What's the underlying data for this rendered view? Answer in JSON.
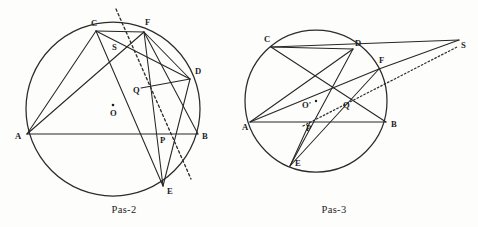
{
  "figure": {
    "background_color": "#fdfdfc",
    "ink_color": "#262626",
    "panels": [
      {
        "id": "pas-2",
        "caption": "Pas-2",
        "caption_pos": {
          "x": 124,
          "y": 213
        },
        "circle": {
          "cx": 113,
          "cy": 109,
          "r": 87
        },
        "center_marker": {
          "label": "O",
          "x": 113,
          "y": 105,
          "label_x": 110,
          "label_y": 116
        },
        "points": [
          {
            "name": "A",
            "x": 27,
            "y": 134,
            "label_x": 15,
            "label_y": 139
          },
          {
            "name": "B",
            "x": 198,
            "y": 134,
            "label_x": 202,
            "label_y": 139
          },
          {
            "name": "C",
            "x": 96,
            "y": 31,
            "label_x": 91,
            "label_y": 26
          },
          {
            "name": "D",
            "x": 190,
            "y": 79,
            "label_x": 195,
            "label_y": 74
          },
          {
            "name": "E",
            "x": 163,
            "y": 186,
            "label_x": 167,
            "label_y": 194
          },
          {
            "name": "F",
            "x": 144,
            "y": 32,
            "label_x": 145,
            "label_y": 25
          },
          {
            "name": "S",
            "x": 119,
            "y": 51,
            "label_x": 112,
            "label_y": 50
          },
          {
            "name": "P",
            "x": 166,
            "y": 134,
            "label_x": 160,
            "label_y": 143
          },
          {
            "name": "Q",
            "x": 141,
            "y": 88,
            "label_x": 133,
            "label_y": 93
          }
        ],
        "solid_segments": [
          [
            "A",
            "B"
          ],
          [
            "A",
            "C"
          ],
          [
            "A",
            "F"
          ],
          [
            "C",
            "F"
          ],
          [
            "C",
            "D"
          ],
          [
            "C",
            "E"
          ],
          [
            "F",
            "E"
          ],
          [
            "F",
            "D"
          ],
          [
            "D",
            "E"
          ],
          [
            "D",
            "P"
          ],
          [
            "B",
            "F"
          ],
          [
            "B",
            "D"
          ]
        ],
        "dashed_line": {
          "x1": 116,
          "y1": 9,
          "x2": 191,
          "y2": 179
        }
      },
      {
        "id": "pas-3",
        "caption": "Pas-3",
        "caption_pos": {
          "x": 334,
          "y": 213
        },
        "circle": {
          "cx": 316,
          "cy": 101,
          "r": 71
        },
        "center_marker": {
          "label": "O'",
          "x": 316,
          "y": 101,
          "label_x": 302,
          "label_y": 108
        },
        "points": [
          {
            "name": "A",
            "x": 250,
            "y": 122,
            "label_x": 242,
            "label_y": 130
          },
          {
            "name": "B",
            "x": 386,
            "y": 122,
            "label_x": 391,
            "label_y": 127
          },
          {
            "name": "C",
            "x": 271,
            "y": 47,
            "label_x": 264,
            "label_y": 42
          },
          {
            "name": "D",
            "x": 353,
            "y": 49,
            "label_x": 355,
            "label_y": 46
          },
          {
            "name": "E",
            "x": 290,
            "y": 166,
            "label_x": 295,
            "label_y": 166
          },
          {
            "name": "F",
            "x": 379,
            "y": 69,
            "label_x": 379,
            "label_y": 63
          },
          {
            "name": "S",
            "x": 459,
            "y": 40,
            "label_x": 461,
            "label_y": 48
          },
          {
            "name": "P",
            "x": 310,
            "y": 122,
            "label_x": 306,
            "label_y": 131
          },
          {
            "name": "Q",
            "x": 348,
            "y": 103,
            "label_x": 343,
            "label_y": 108
          }
        ],
        "solid_segments": [
          [
            "A",
            "B"
          ],
          [
            "A",
            "D"
          ],
          [
            "A",
            "F"
          ],
          [
            "C",
            "D"
          ],
          [
            "C",
            "S"
          ],
          [
            "C",
            "Q"
          ],
          [
            "D",
            "E"
          ],
          [
            "E",
            "F"
          ],
          [
            "F",
            "B"
          ],
          [
            "F",
            "S"
          ],
          [
            "B",
            "Q"
          ],
          [
            "E",
            "Q"
          ]
        ],
        "dotted_line": {
          "x1": 303,
          "y1": 126,
          "x2": 457,
          "y2": 47
        }
      }
    ]
  }
}
